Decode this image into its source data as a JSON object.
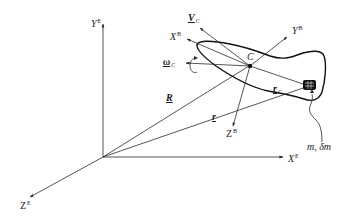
{
  "diagram": {
    "type": "rigid-body-coordinate-frames",
    "colors": {
      "line": "#2a2a2a",
      "body_outline": "#111111",
      "background": "#ffffff"
    },
    "earth_frame": {
      "x_axis": {
        "symbol": "X",
        "superscript": "E"
      },
      "y_axis": {
        "symbol": "Y",
        "superscript": "E"
      },
      "z_axis": {
        "symbol": "Z",
        "superscript": "E"
      }
    },
    "body_frame": {
      "x_axis": {
        "symbol": "X",
        "superscript": "B"
      },
      "y_axis": {
        "symbol": "Y",
        "superscript": "B"
      },
      "z_axis": {
        "symbol": "Z",
        "superscript": "B"
      }
    },
    "center_of_mass": {
      "symbol": "C"
    },
    "vectors": {
      "velocity": {
        "symbol": "V",
        "subscript": "C"
      },
      "angular_velocity": {
        "symbol": "ω",
        "subscript": "C"
      },
      "position_R": {
        "symbol": "R"
      },
      "position_r": {
        "symbol": "r"
      },
      "position_rc": {
        "symbol": "r",
        "subscript": "C"
      }
    },
    "mass_element": {
      "label": "m, δm"
    }
  }
}
